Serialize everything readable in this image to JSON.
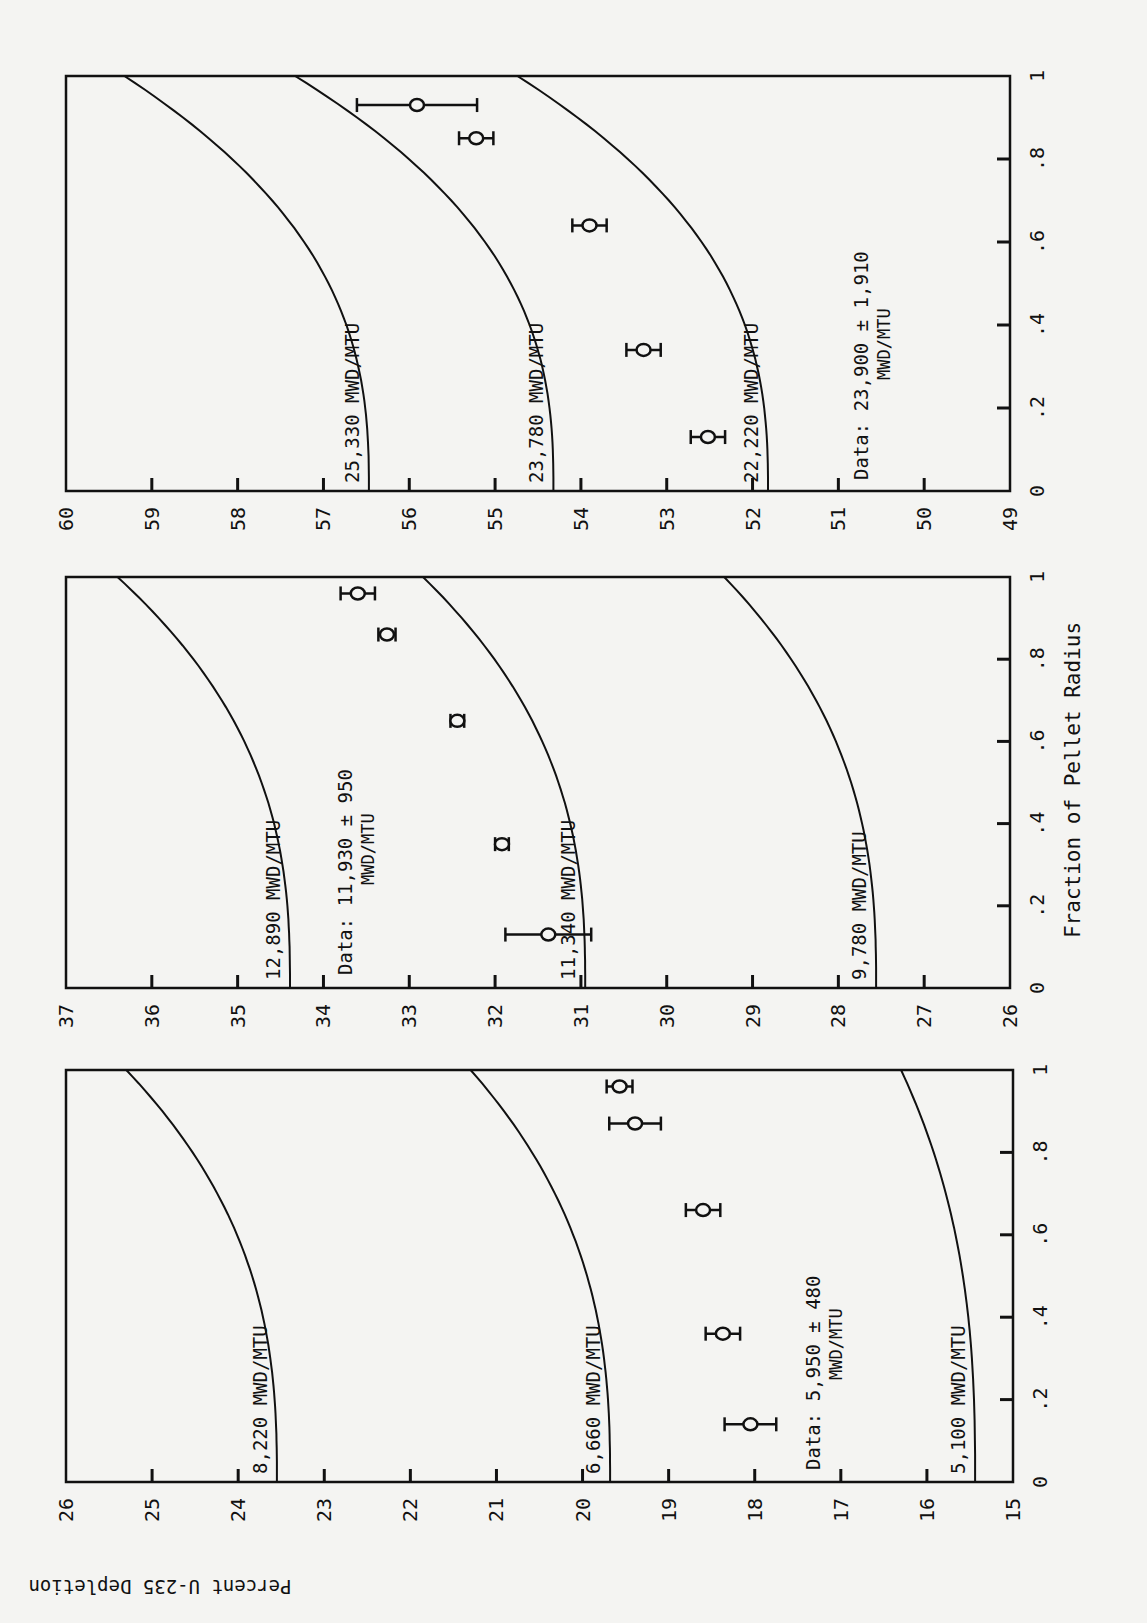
{
  "figure": {
    "y_axis_label": "Percent U-235 Depletion",
    "x_axis_label": "Fraction of Pellet Radius",
    "x_ticks": [
      "0",
      ".2",
      ".4",
      ".6",
      ".8",
      "1"
    ]
  },
  "chart_data": [
    {
      "type": "scatter",
      "title": "",
      "xlabel": "Fraction of Pellet Radius",
      "ylabel": "Percent U-235 Depletion",
      "xlim": [
        0,
        1
      ],
      "ylim": [
        15,
        26
      ],
      "y_ticks": [
        15,
        16,
        17,
        18,
        19,
        20,
        21,
        22,
        23,
        24,
        25,
        26
      ],
      "curves": [
        {
          "name": "8,220 MWD/MTU",
          "at_r0": 23.55,
          "at_r1": 25.3
        },
        {
          "name": "6,660 MWD/MTU",
          "at_r0": 19.68,
          "at_r1": 21.3
        },
        {
          "name": "5,100 MWD/MTU",
          "at_r0": 15.44,
          "at_r1": 16.3
        }
      ],
      "data_label": "Data:  5,950 ± 480 MWD/MTU",
      "data_points": {
        "x": [
          0.14,
          0.36,
          0.66,
          0.87,
          0.96
        ],
        "y": [
          18.05,
          18.37,
          18.6,
          19.39,
          19.57
        ],
        "err": [
          0.3,
          0.2,
          0.2,
          0.3,
          0.15
        ]
      }
    },
    {
      "type": "scatter",
      "title": "",
      "xlabel": "Fraction of Pellet Radius",
      "ylabel": "Percent U-235 Depletion",
      "xlim": [
        0,
        1
      ],
      "ylim": [
        26,
        37
      ],
      "y_ticks": [
        26,
        27,
        28,
        29,
        30,
        31,
        32,
        33,
        34,
        35,
        36,
        37
      ],
      "curves": [
        {
          "name": "12,890 MWD/MTU",
          "at_r0": 34.39,
          "at_r1": 36.4
        },
        {
          "name": "11,340 MWD/MTU",
          "at_r0": 30.95,
          "at_r1": 32.84
        },
        {
          "name": "9,780 MWD/MTU",
          "at_r0": 27.56,
          "at_r1": 29.33
        }
      ],
      "data_label": "Data:  11,930 ± 950 MWD/MTU",
      "data_points": {
        "x": [
          0.13,
          0.35,
          0.65,
          0.86,
          0.96
        ],
        "y": [
          31.38,
          31.92,
          32.44,
          33.26,
          33.6
        ],
        "err": [
          0.5,
          0.08,
          0.08,
          0.1,
          0.2
        ]
      }
    },
    {
      "type": "scatter",
      "title": "",
      "xlabel": "Fraction of Pellet Radius",
      "ylabel": "Percent U-235 Depletion",
      "xlim": [
        0,
        1
      ],
      "ylim": [
        49,
        60
      ],
      "y_ticks": [
        49,
        50,
        51,
        52,
        53,
        54,
        55,
        56,
        57,
        58,
        59,
        60
      ],
      "curves": [
        {
          "name": "25,330 MWD/MTU",
          "at_r0": 56.47,
          "at_r1": 59.32
        },
        {
          "name": "23,780 MWD/MTU",
          "at_r0": 54.32,
          "at_r1": 57.33
        },
        {
          "name": "22,220 MWD/MTU",
          "at_r0": 51.82,
          "at_r1": 54.74
        }
      ],
      "data_label": "Data:  23,900 ± 1,910 MWD/MTU",
      "data_points": {
        "x": [
          0.13,
          0.34,
          0.64,
          0.85,
          0.93
        ],
        "y": [
          52.52,
          53.27,
          53.9,
          55.22,
          55.91
        ],
        "err": [
          0.2,
          0.2,
          0.2,
          0.2,
          0.7
        ]
      }
    }
  ],
  "panels": [
    {
      "curve_labels": [
        "8,220 MWD/MTU",
        "6,660 MWD/MTU",
        "5,100 MWD/MTU"
      ],
      "data_line1": "Data:  5,950 ± 480",
      "data_line2": "MWD/MTU"
    },
    {
      "curve_labels": [
        "12,890 MWD/MTU",
        "11,340 MWD/MTU",
        "9,780 MWD/MTU"
      ],
      "data_line1": "Data:  11,930 ± 950",
      "data_line2": "MWD/MTU"
    },
    {
      "curve_labels": [
        "25,330 MWD/MTU",
        "23,780 MWD/MTU",
        "22,220 MWD/MTU"
      ],
      "data_line1": "Data:  23,900 ± 1,910",
      "data_line2": "MWD/MTU"
    }
  ]
}
